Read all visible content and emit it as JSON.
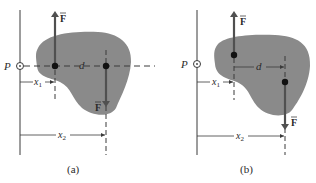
{
  "figure": {
    "panels": [
      {
        "id": "a",
        "caption": "(a)",
        "point_label": "P",
        "force_label_up": "F",
        "force_label_down": "F",
        "distance_d_label": "d",
        "x1_label": "x",
        "x1_sub": "1",
        "x2_label": "x",
        "x2_sub": "2"
      },
      {
        "id": "b",
        "caption": "(b)",
        "point_label": "P",
        "force_label_up": "F",
        "force_label_down": "F",
        "distance_d_label": "d",
        "x1_label": "x",
        "x1_sub": "1",
        "x2_label": "x",
        "x2_sub": "2"
      }
    ],
    "colors": {
      "body_fill": "#8a8a8a",
      "arrow": "#505050",
      "line": "#3a3a3a",
      "dot": "#111111"
    }
  }
}
